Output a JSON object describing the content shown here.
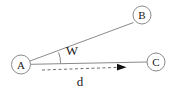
{
  "diagram": {
    "nodes": [
      {
        "id": "A",
        "label": "A"
      },
      {
        "id": "B",
        "label": "B"
      },
      {
        "id": "C",
        "label": "C"
      }
    ],
    "angle": {
      "label": "W"
    },
    "distance": {
      "label": "d"
    },
    "colors": {
      "line": "#8a8a8a",
      "circle_stroke": "#8a8a8a",
      "circle_fill": "#ffffff",
      "dash": "#6e6e6e",
      "arrowhead": "#111111",
      "text": "#1a1a1a"
    }
  }
}
